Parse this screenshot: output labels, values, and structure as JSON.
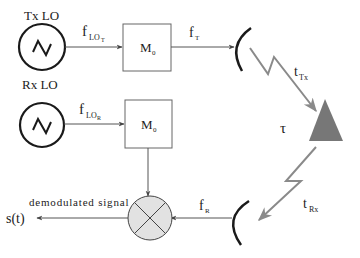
{
  "diagram": {
    "type": "radar-block-diagram",
    "tx_lo": {
      "label": "Tx LO",
      "icon": "sine-oscillator-icon"
    },
    "rx_lo": {
      "label": "Rx LO",
      "icon": "sine-oscillator-icon"
    },
    "f_lo_t": {
      "main": "f",
      "sub": "LO",
      "subsub": "T"
    },
    "f_lo_r": {
      "main": "f",
      "sub": "LO",
      "subsub": "R"
    },
    "modulator_top": {
      "main": "M",
      "sub": "0"
    },
    "modulator_bottom": {
      "main": "M",
      "sub": "0"
    },
    "f_t": {
      "main": "f",
      "sub": "T"
    },
    "f_r": {
      "main": "f",
      "sub": "R"
    },
    "t_tx": {
      "main": "t",
      "sub": "Tx"
    },
    "t_rx": {
      "main": "t",
      "sub": "Rx"
    },
    "tau": "τ",
    "mixer_label": "demodulated signal",
    "output": "s(t)",
    "colors": {
      "line": "#555555",
      "bold_line": "#1a1a1a",
      "beam": "#8a8a8a",
      "target": "#777777",
      "mixer_fill": "#e2e2e2"
    }
  }
}
